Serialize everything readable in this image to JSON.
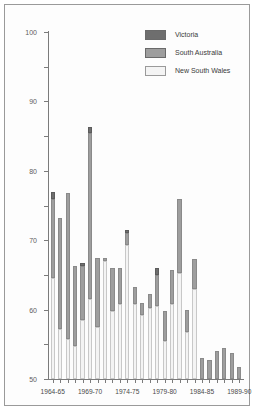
{
  "chart_data": {
    "type": "bar",
    "subtype": "stacked-vertical",
    "title": "",
    "xlabel": "",
    "ylabel": "",
    "ylim": [
      0,
      100
    ],
    "yticks": [
      0,
      10,
      20,
      30,
      40,
      50,
      60,
      70,
      80,
      90,
      100
    ],
    "grid": false,
    "legend_position": "top-right",
    "categories": [
      "1964-65",
      "1965-66",
      "1966-67",
      "1967-68",
      "1968-69",
      "1969-70",
      "1970-71",
      "1971-72",
      "1972-73",
      "1973-74",
      "1974-75",
      "1975-76",
      "1976-77",
      "1977-78",
      "1978-79",
      "1979-80",
      "1980-81",
      "1981-82",
      "1982-83",
      "1983-84",
      "1984-85",
      "1985-86",
      "1986-87",
      "1987-88",
      "1988-89",
      "1989-90"
    ],
    "labelled_ticks": [
      "1964-65",
      "1969-70",
      "1974-75",
      "1979-80",
      "1984-85",
      "1989-90"
    ],
    "series": [
      {
        "name": "New South Wales",
        "color": "#f4f4f4",
        "values": [
          29,
          14.5,
          11.5,
          9.5,
          17,
          23,
          15,
          34,
          19.5,
          21.5,
          38.5,
          21.5,
          18.5,
          20.5,
          21,
          11,
          21.5,
          30.5,
          13.5,
          26,
          0,
          0,
          0,
          0,
          0,
          0
        ]
      },
      {
        "name": "South Australia",
        "color": "#9e9e9e",
        "values": [
          23,
          32,
          42,
          23,
          15.5,
          48,
          20,
          1,
          12.5,
          10.5,
          3.5,
          5,
          3.5,
          4,
          9,
          8.5,
          10,
          21.5,
          6.5,
          8.5,
          6,
          5.5,
          8,
          9,
          7.5,
          3.5
        ]
      },
      {
        "name": "Victoria",
        "color": "#6e6e6e",
        "values": [
          2,
          0,
          0,
          0,
          1,
          1.5,
          0,
          0,
          0,
          0,
          1,
          0,
          0,
          0,
          2,
          0,
          0,
          0,
          0,
          0,
          0,
          0,
          0,
          0,
          0,
          0
        ]
      }
    ],
    "totals": [
      54,
      46.5,
      53.5,
      32.5,
      33.5,
      72.5,
      35,
      35,
      32,
      32,
      43,
      26.5,
      22,
      24.5,
      32,
      19.5,
      31.5,
      52,
      20,
      34.5,
      6,
      5.5,
      8,
      9,
      7.5,
      3.5
    ]
  },
  "legend": {
    "items": [
      {
        "label": "Victoria",
        "color": "#6e6e6e"
      },
      {
        "label": "South Australia",
        "color": "#9e9e9e"
      },
      {
        "label": "New South Wales",
        "color": "#f4f4f4"
      }
    ]
  }
}
